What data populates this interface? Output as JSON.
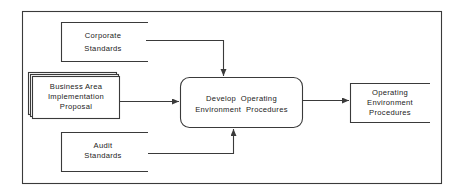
{
  "diagram": {
    "type": "data-flow",
    "process": {
      "label_lines": [
        "Develop  Operating",
        "Environment  Procedures"
      ]
    },
    "inputs": [
      {
        "id": "corporate-standards",
        "shape": "data-store",
        "label_lines": [
          "Corporate",
          "Standards"
        ],
        "connects_to": "process",
        "side": "top"
      },
      {
        "id": "business-area-proposal",
        "shape": "document-stack",
        "label_lines": [
          "Business  Area",
          "Implementation",
          "Proposal"
        ],
        "connects_to": "process",
        "side": "left"
      },
      {
        "id": "audit-standards",
        "shape": "data-store",
        "label_lines": [
          "Audit",
          "Standards"
        ],
        "connects_to": "process",
        "side": "bottom"
      }
    ],
    "outputs": [
      {
        "id": "operating-environment-procedures",
        "shape": "data-store",
        "label_lines": [
          "Operating",
          "Environment",
          "Procedures"
        ],
        "connected_from": "process",
        "side": "right"
      }
    ],
    "colors": {
      "stroke": "#3a3a3a",
      "text": "#222222",
      "background": "#ffffff"
    }
  }
}
